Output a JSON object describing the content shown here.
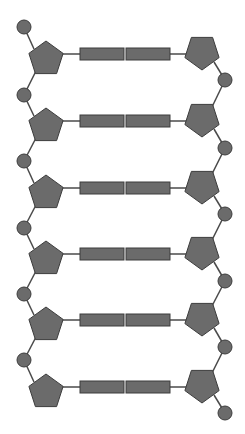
{
  "colors": {
    "shape_fill": "#6b6b6b",
    "shape_stroke": "#3c3c3c",
    "line": "#4a4a4a",
    "background": "#ffffff"
  },
  "diagram": {
    "type": "dna-ladder",
    "rows": 6,
    "row_centers_y": [
      54,
      121,
      188,
      254,
      320,
      387
    ],
    "left_strand": {
      "phosphate_x": 24,
      "phosphate_y": [
        27,
        95,
        161,
        228,
        294,
        360
      ],
      "sugar_x": 46,
      "sugar_orientation": "point-up"
    },
    "right_strand": {
      "phosphate_x": 225,
      "phosphate_y": [
        80,
        148,
        214,
        281,
        347,
        413
      ],
      "sugar_x": 202,
      "sugar_orientation": "point-down"
    },
    "base_pairs": {
      "left_base_x": [
        80,
        124
      ],
      "right_base_x": [
        126,
        170
      ],
      "height": 12
    },
    "legend_labels": []
  }
}
